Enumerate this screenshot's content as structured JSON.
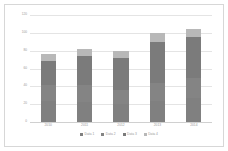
{
  "chart_data": {
    "type": "bar",
    "subtype": "stacked-column",
    "title": "",
    "xlabel": "",
    "ylabel": "",
    "categories": [
      "2010",
      "2011",
      "2012",
      "2013",
      "2014"
    ],
    "series": [
      {
        "name": "Data 1",
        "color": "#808080",
        "values": [
          24,
          22,
          20,
          24,
          27
        ]
      },
      {
        "name": "Data 2",
        "color": "#848484",
        "values": [
          18,
          19,
          16,
          20,
          22
        ]
      },
      {
        "name": "Data 3",
        "color": "#7b7b7b",
        "values": [
          26,
          33,
          36,
          46,
          46
        ]
      },
      {
        "name": "Data 4",
        "color": "#b8b8b8",
        "values": [
          8,
          8,
          8,
          10,
          9
        ]
      }
    ],
    "totals": [
      76,
      82,
      80,
      100,
      104
    ],
    "ylim": [
      0,
      120
    ],
    "yticks": [
      0,
      20,
      40,
      60,
      80,
      100,
      120
    ],
    "ytick_labels": [
      "0",
      "20",
      "40",
      "60",
      "80",
      "100",
      "120"
    ],
    "grid": true,
    "legend_position": "bottom",
    "axis_color": "#d0d0d0",
    "gridline_color": "#e4e4e4",
    "tick_label_color": "#9a9a9a",
    "plot_background": "#ffffff",
    "frame_color": "#d7d7d7"
  }
}
